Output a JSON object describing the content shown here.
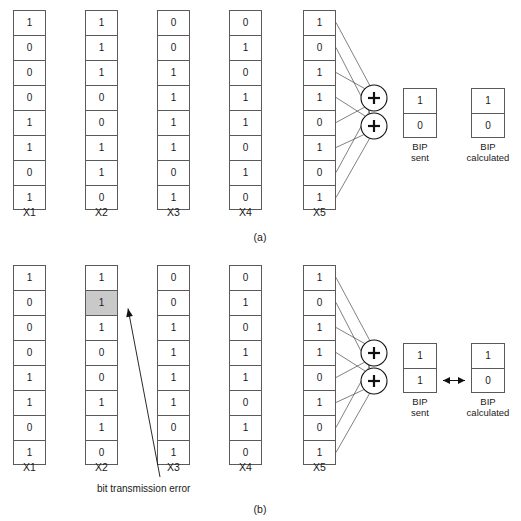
{
  "figure": {
    "panels": [
      {
        "id": "a",
        "caption": "(a)",
        "columns": [
          {
            "label": "X1",
            "bits": [
              "1",
              "0",
              "0",
              "0",
              "1",
              "1",
              "0",
              "1"
            ],
            "error_index": null
          },
          {
            "label": "X2",
            "bits": [
              "1",
              "1",
              "1",
              "0",
              "0",
              "1",
              "1",
              "0"
            ],
            "error_index": null
          },
          {
            "label": "X3",
            "bits": [
              "0",
              "0",
              "1",
              "1",
              "1",
              "1",
              "0",
              "1"
            ],
            "error_index": null
          },
          {
            "label": "X4",
            "bits": [
              "0",
              "1",
              "0",
              "1",
              "1",
              "0",
              "1",
              "0"
            ],
            "error_index": null
          },
          {
            "label": "X5",
            "bits": [
              "1",
              "0",
              "1",
              "1",
              "0",
              "1",
              "0",
              "1"
            ],
            "error_index": null
          }
        ],
        "xor_nodes": [
          "+",
          "+"
        ],
        "bip_sent": {
          "bits": [
            "1",
            "0"
          ],
          "caption_line1": "BIP",
          "caption_line2": "sent"
        },
        "bip_calculated": {
          "bits": [
            "1",
            "0"
          ],
          "caption_line1": "BIP",
          "caption_line2": "calculated"
        },
        "mismatch_arrow": false,
        "error_label": null
      },
      {
        "id": "b",
        "caption": "(b)",
        "columns": [
          {
            "label": "X1",
            "bits": [
              "1",
              "0",
              "0",
              "0",
              "1",
              "1",
              "0",
              "1"
            ],
            "error_index": null
          },
          {
            "label": "X2",
            "bits": [
              "1",
              "1",
              "1",
              "0",
              "0",
              "1",
              "1",
              "0"
            ],
            "error_index": 1
          },
          {
            "label": "X3",
            "bits": [
              "0",
              "0",
              "1",
              "1",
              "1",
              "1",
              "0",
              "1"
            ],
            "error_index": null
          },
          {
            "label": "X4",
            "bits": [
              "0",
              "1",
              "0",
              "1",
              "1",
              "0",
              "1",
              "0"
            ],
            "error_index": null
          },
          {
            "label": "X5",
            "bits": [
              "1",
              "0",
              "1",
              "1",
              "0",
              "1",
              "0",
              "1"
            ],
            "error_index": null
          }
        ],
        "xor_nodes": [
          "+",
          "+"
        ],
        "bip_sent": {
          "bits": [
            "1",
            "1"
          ],
          "caption_line1": "BIP",
          "caption_line2": "sent"
        },
        "bip_calculated": {
          "bits": [
            "1",
            "0"
          ],
          "caption_line1": "BIP",
          "caption_line2": "calculated"
        },
        "mismatch_arrow": true,
        "error_label": "bit transmission error"
      }
    ],
    "colors": {
      "error_cell_fill": "#c9c9c9",
      "cell_border": "#5a5a5a",
      "wire": "#4a4a4a",
      "background": "#ffffff"
    }
  }
}
